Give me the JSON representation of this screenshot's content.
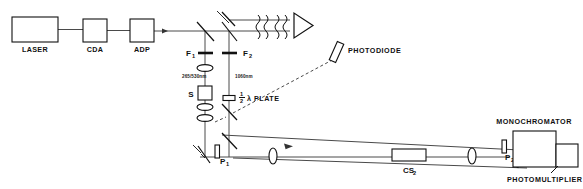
{
  "figure": {
    "type": "optical-layout-diagram"
  },
  "sources": [
    {
      "id": "laser",
      "label": "LASER",
      "x": 12,
      "y": 17,
      "w": 46,
      "h": 25
    },
    {
      "id": "cda",
      "label": "CDA",
      "x": 83,
      "y": 19,
      "w": 24,
      "h": 23
    },
    {
      "id": "adp",
      "label": "ADP",
      "x": 130,
      "y": 19,
      "w": 24,
      "h": 23
    }
  ],
  "components": {
    "filter_1": "F",
    "filter_1_sub": "1",
    "filter_2": "F",
    "filter_2_sub": "2",
    "sample": "S",
    "polarizer_1": "P",
    "polarizer_1_sub": "1",
    "polarizer_2": "P",
    "polarizer_2_sub": "2",
    "half_wave_plate": "λ  PLATE",
    "half_wave_numerator": "1",
    "half_wave_denominator": "2",
    "photodiode": "PHOTODIODE",
    "cs2": "CS",
    "cs2_sub": "2",
    "monochromator": "MONOCHROMATOR",
    "photomultiplier": "PHOTOMULTIPLIER"
  },
  "wavelengths": {
    "pump": "265/530nm",
    "fundamental": "1060nm"
  },
  "colors": {
    "line": "#111111",
    "beam": "#4a4a4a",
    "background": "#ffffff"
  }
}
